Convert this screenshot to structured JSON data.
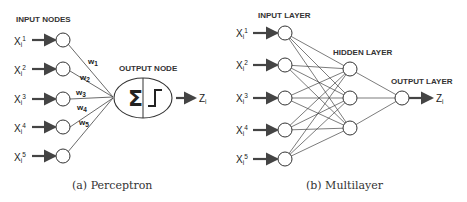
{
  "perceptron": {
    "input_title": "INPUT NODES",
    "output_title": "OUTPUT NODE",
    "inputs": [
      {
        "label": "X",
        "sub": "i",
        "sup": "1"
      },
      {
        "label": "X",
        "sub": "i",
        "sup": "2"
      },
      {
        "label": "X",
        "sub": "i",
        "sup": "3"
      },
      {
        "label": "X",
        "sub": "i",
        "sup": "4"
      },
      {
        "label": "X",
        "sub": "i",
        "sup": "5"
      }
    ],
    "weights": [
      {
        "label": "w",
        "sub": "1"
      },
      {
        "label": "w",
        "sub": "2"
      },
      {
        "label": "w",
        "sub": "3"
      },
      {
        "label": "w",
        "sub": "4"
      },
      {
        "label": "w",
        "sub": "5"
      }
    ],
    "sum_symbol": "Σ",
    "output": {
      "label": "Z",
      "sub": "i"
    },
    "caption": "(a) Perceptron"
  },
  "multilayer": {
    "input_title": "INPUT LAYER",
    "hidden_title": "HIDDEN LAYER",
    "output_title": "OUTPUT LAYER",
    "inputs": [
      {
        "label": "X",
        "sub": "i",
        "sup": "1"
      },
      {
        "label": "X",
        "sub": "i",
        "sup": "2"
      },
      {
        "label": "X",
        "sub": "i",
        "sup": "3"
      },
      {
        "label": "X",
        "sub": "i",
        "sup": "4"
      },
      {
        "label": "X",
        "sub": "i",
        "sup": "5"
      }
    ],
    "hidden_count": 3,
    "output": {
      "label": "Z",
      "sub": "i"
    },
    "caption": "(b) Multilayer"
  }
}
